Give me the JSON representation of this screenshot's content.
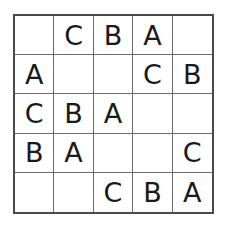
{
  "puzzle": {
    "rows": 5,
    "cols": 5,
    "cells": [
      [
        "",
        "C",
        "B",
        "A",
        ""
      ],
      [
        "A",
        "",
        "",
        "C",
        "B"
      ],
      [
        "C",
        "B",
        "A",
        "",
        ""
      ],
      [
        "B",
        "A",
        "",
        "",
        "C"
      ],
      [
        "",
        "",
        "C",
        "B",
        "A"
      ]
    ]
  }
}
